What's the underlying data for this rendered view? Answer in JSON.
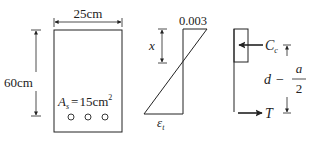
{
  "section": {
    "width_label": "25cm",
    "height_label": "60cm",
    "steel_area": {
      "symbol": "A",
      "subscript": "s",
      "equals": "=",
      "value": "15cm",
      "superscript": "2"
    },
    "bar_count": 3
  },
  "strain": {
    "top_strain": "0.003",
    "neutral_axis_label": "x",
    "bottom_strain_symbol": "ε",
    "bottom_strain_subscript": "t"
  },
  "forces": {
    "compression_symbol": "C",
    "compression_subscript": "c",
    "tension_symbol": "T",
    "lever_arm": {
      "d": "d",
      "minus": "−",
      "numerator": "a",
      "denominator": "2"
    }
  },
  "colors": {
    "stroke": "#222222",
    "background": "#ffffff"
  }
}
